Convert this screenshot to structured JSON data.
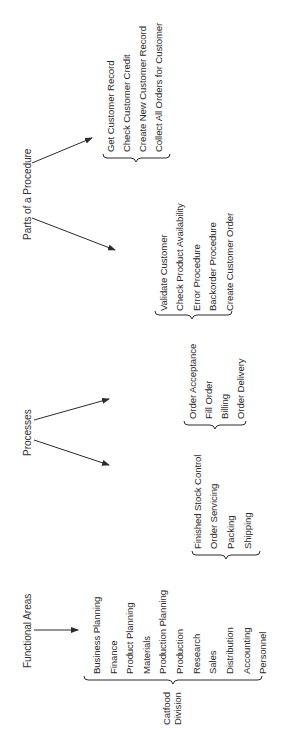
{
  "diagram": {
    "headers": {
      "functional_areas": "Functional Areas",
      "processes": "Processes",
      "parts_of_procedure": "Parts of a Procedure"
    },
    "division": {
      "line1": "Catfood",
      "line2": "Division"
    },
    "functional_areas": [
      "Business Planning",
      "Finance",
      "Product Planning",
      "Materials",
      "Production Planning",
      "Production",
      "Research",
      "Sales",
      "Distribution",
      "Accounting",
      "Personnel"
    ],
    "process_groups": [
      {
        "items": [
          "Finished Stock Control",
          "Order Servicing",
          "Packing",
          "Shipping"
        ]
      },
      {
        "items": [
          "Order Acceptance",
          "Fill Order",
          "Billing",
          "Order Delivery"
        ]
      }
    ],
    "procedure_groups": [
      {
        "items": [
          "Validate Customer",
          "Check Product Availability",
          "Error Procedure",
          "Backorder Procedure",
          "Create Customer Order"
        ]
      },
      {
        "items": [
          "Get Customer Record",
          "Check Customer Credit",
          "Create New Customer Record",
          "Collect All Orders for Customer"
        ]
      }
    ],
    "colors": {
      "ink": "#2b2b2b",
      "background": "#ffffff"
    }
  }
}
